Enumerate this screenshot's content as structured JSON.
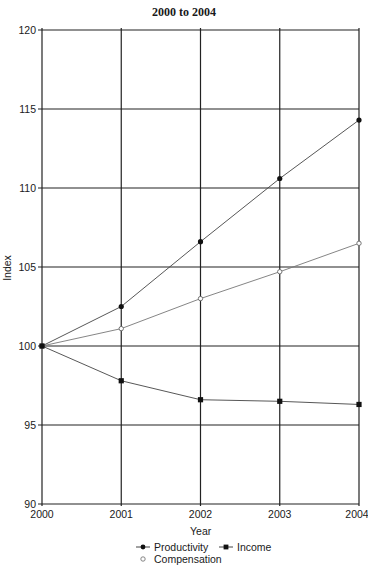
{
  "chart_data": {
    "type": "line",
    "title": "",
    "subtitle": "2000 to 2004",
    "title_partially_visible": "…, … and … …",
    "xlabel": "Year",
    "ylabel": "Index",
    "x": [
      2000,
      2001,
      2002,
      2003,
      2004
    ],
    "x_tick_labels": [
      "2000",
      "2001",
      "2002",
      "2003",
      "2004"
    ],
    "y_tick_labels": [
      "90",
      "95",
      "100",
      "105",
      "110",
      "115",
      "120"
    ],
    "ylim": [
      90,
      120
    ],
    "grid": true,
    "legend_position": "bottom",
    "series": [
      {
        "name": "Productivity",
        "marker": "filled-circle",
        "values": [
          100.0,
          102.5,
          106.6,
          110.6,
          114.3
        ]
      },
      {
        "name": "Compensation",
        "marker": "open-circle",
        "values": [
          100.0,
          101.1,
          103.0,
          104.7,
          106.5
        ]
      },
      {
        "name": "Income",
        "marker": "filled-square",
        "values": [
          100.0,
          97.8,
          96.6,
          96.5,
          96.3
        ]
      }
    ]
  },
  "header": {
    "title_line1": "",
    "title_line2": "2000 to 2004"
  },
  "axes": {
    "x_label": "Year",
    "y_label": "Index"
  },
  "legend": {
    "items": [
      {
        "label": "Productivity"
      },
      {
        "label": "Income"
      },
      {
        "label": "Compensation"
      }
    ]
  },
  "colors": {
    "line": "#444444",
    "grid": "#222222",
    "marker": "#111111"
  }
}
